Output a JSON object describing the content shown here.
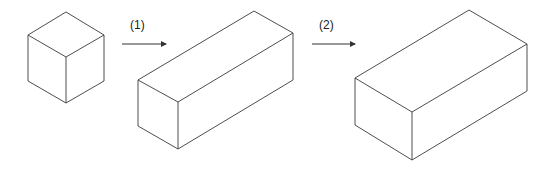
{
  "diagram": {
    "steps": [
      {
        "label": "(1)"
      },
      {
        "label": "(2)"
      }
    ],
    "shapes": [
      {
        "name": "cube",
        "vertices": {
          "top": [
            66,
            12
          ],
          "lt": [
            28,
            35
          ],
          "rt": [
            104,
            35
          ],
          "c": [
            66,
            57
          ],
          "lb": [
            28,
            81
          ],
          "rb": [
            104,
            81
          ],
          "b": [
            66,
            103
          ]
        }
      },
      {
        "name": "long-box",
        "vertices": {
          "top": [
            254,
            11
          ],
          "lt": [
            138,
            80
          ],
          "rt": [
            293,
            33
          ],
          "c": [
            178,
            102
          ],
          "lb": [
            138,
            126
          ],
          "rb": [
            293,
            80
          ],
          "b": [
            178,
            149
          ]
        }
      },
      {
        "name": "wide-box",
        "vertices": {
          "top": [
            469,
            10
          ],
          "lt": [
            355,
            78
          ],
          "rt": [
            527,
            44
          ],
          "c": [
            412,
            112
          ],
          "lb": [
            355,
            125
          ],
          "rb": [
            527,
            91
          ],
          "b": [
            412,
            160
          ]
        }
      }
    ],
    "colors": {
      "stroke": "#3a3a3a",
      "background": "#ffffff"
    }
  }
}
